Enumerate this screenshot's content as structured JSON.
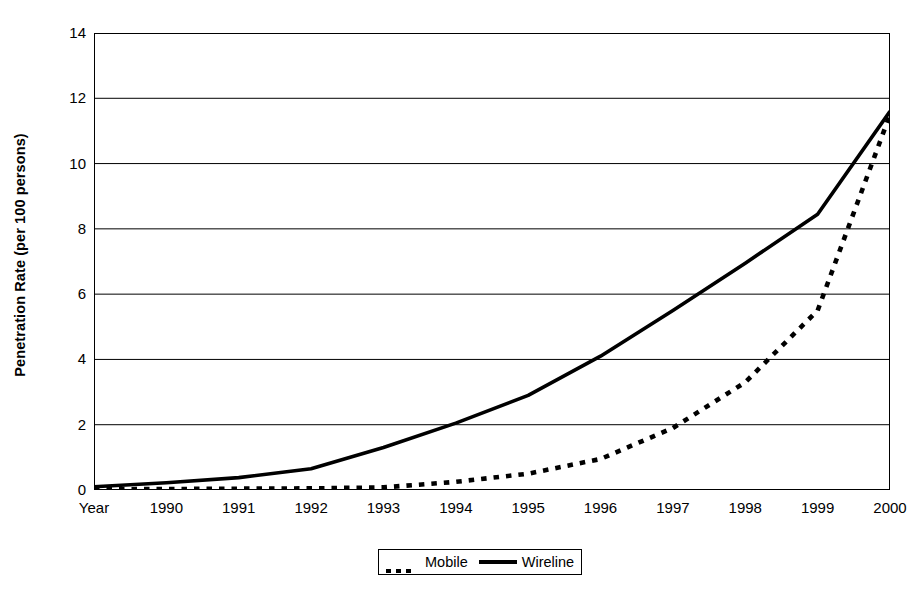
{
  "chart_data": {
    "type": "line",
    "title": "",
    "subtitle": "",
    "xlabel": "",
    "ylabel": "Penetration Rate (per 100 persons)",
    "categories": [
      "Year",
      "1990",
      "1991",
      "1992",
      "1993",
      "1994",
      "1995",
      "1996",
      "1997",
      "1998",
      "1999",
      "2000"
    ],
    "x_tick_labels": [
      "Year",
      "1990",
      "1991",
      "1992",
      "1993",
      "1994",
      "1995",
      "1996",
      "1997",
      "1998",
      "1999",
      "2000"
    ],
    "y_tick_labels": [
      "0",
      "2",
      "4",
      "6",
      "8",
      "10",
      "12",
      "14"
    ],
    "y_ticks": [
      0,
      2,
      4,
      6,
      8,
      10,
      12,
      14
    ],
    "ylim": [
      0,
      14
    ],
    "xlim_index": [
      0,
      11
    ],
    "grid": "horizontal",
    "legend_position": "bottom-center",
    "series": [
      {
        "name": "Mobile",
        "style": "dotted",
        "color": "#000000",
        "values": [
          0.02,
          0.03,
          0.04,
          0.05,
          0.08,
          0.25,
          0.5,
          0.95,
          1.9,
          3.3,
          5.5,
          11.5
        ]
      },
      {
        "name": "Wireline",
        "style": "solid",
        "color": "#000000",
        "values": [
          0.1,
          0.22,
          0.38,
          0.65,
          1.3,
          2.05,
          2.9,
          4.1,
          5.5,
          6.95,
          8.45,
          11.6
        ]
      }
    ]
  },
  "legend": {
    "entries": [
      {
        "label": "Mobile",
        "marker": "dotted-line-swatch"
      },
      {
        "label": "Wireline",
        "marker": "solid-line-swatch"
      }
    ]
  },
  "axis": {
    "y_title": "Penetration Rate (per 100 persons)"
  }
}
